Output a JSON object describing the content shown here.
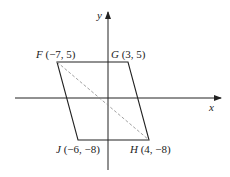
{
  "diagram": {
    "axes": {
      "x_label": "x",
      "y_label": "y"
    },
    "vertices": [
      {
        "name": "F",
        "coords": "(−7, 5)"
      },
      {
        "name": "G",
        "coords": "(3, 5)"
      },
      {
        "name": "H",
        "coords": "(4, −8)"
      },
      {
        "name": "J",
        "coords": "(−6, −8)"
      }
    ],
    "diagonal": "FH (dashed)",
    "colors": {
      "stroke": "#222222",
      "diagonal": "#888888"
    }
  }
}
